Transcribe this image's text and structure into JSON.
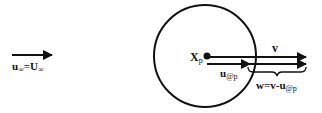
{
  "diagram": {
    "freestream": {
      "label_main": "u",
      "label_sub": "∞",
      "label_eq": "=U",
      "label_sub2": "∞"
    },
    "particle": {
      "label_main": "X",
      "label_sub": "p"
    },
    "velocity_v": {
      "label": "v"
    },
    "velocity_u": {
      "label_main": "u",
      "label_sub": "@p"
    },
    "relative": {
      "label_main": "w=v-u",
      "label_sub": "@p"
    },
    "colors": {
      "stroke": "#111111",
      "background": "#ffffff"
    }
  }
}
